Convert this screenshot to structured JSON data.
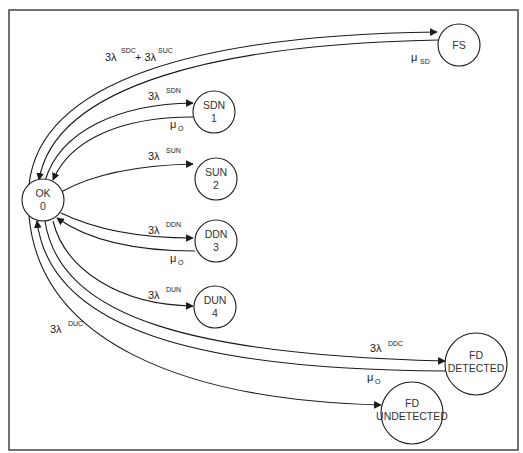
{
  "diagram": {
    "type": "state-transition (Markov) diagram",
    "nodes": [
      {
        "id": "ok",
        "line1": "OK",
        "line2": "0"
      },
      {
        "id": "sdn",
        "line1": "SDN",
        "line2": "1"
      },
      {
        "id": "sun",
        "line1": "SUN",
        "line2": "2"
      },
      {
        "id": "ddn",
        "line1": "DDN",
        "line2": "3"
      },
      {
        "id": "dun",
        "line1": "DUN",
        "line2": "4"
      },
      {
        "id": "fs",
        "line1": "FS",
        "line2": ""
      },
      {
        "id": "fd_detected",
        "line1": "FD",
        "line2": "DETECTED"
      },
      {
        "id": "fd_undetected",
        "line1": "FD",
        "line2": "UNDETECTED"
      }
    ],
    "edges": [
      {
        "from": "OK",
        "to": "FS",
        "label_main": "3λ",
        "label_sup": "SDC",
        "label_plus": "+ 3λ",
        "label_sup2": "SUC"
      },
      {
        "from": "FS",
        "to": "OK",
        "label_main": "μ",
        "label_sub": "SD"
      },
      {
        "from": "OK",
        "to": "SDN",
        "label_main": "3λ",
        "label_sup": "SDN"
      },
      {
        "from": "SDN",
        "to": "OK",
        "label_main": "μ",
        "label_sub": "O"
      },
      {
        "from": "OK",
        "to": "SUN",
        "label_main": "3λ",
        "label_sup": "SUN"
      },
      {
        "from": "OK",
        "to": "DDN",
        "label_main": "3λ",
        "label_sup": "DDN"
      },
      {
        "from": "DDN",
        "to": "OK",
        "label_main": "μ",
        "label_sub": "O"
      },
      {
        "from": "OK",
        "to": "DUN",
        "label_main": "3λ",
        "label_sup": "DUN"
      },
      {
        "from": "OK",
        "to": "FD DETECTED",
        "label_main": "3λ",
        "label_sup": "DDC"
      },
      {
        "from": "FD DETECTED",
        "to": "OK",
        "label_main": "μ",
        "label_sub": "O"
      },
      {
        "from": "OK",
        "to": "FD UNDETECTED",
        "label_main": "3λ",
        "label_sup": "DUC"
      }
    ]
  }
}
